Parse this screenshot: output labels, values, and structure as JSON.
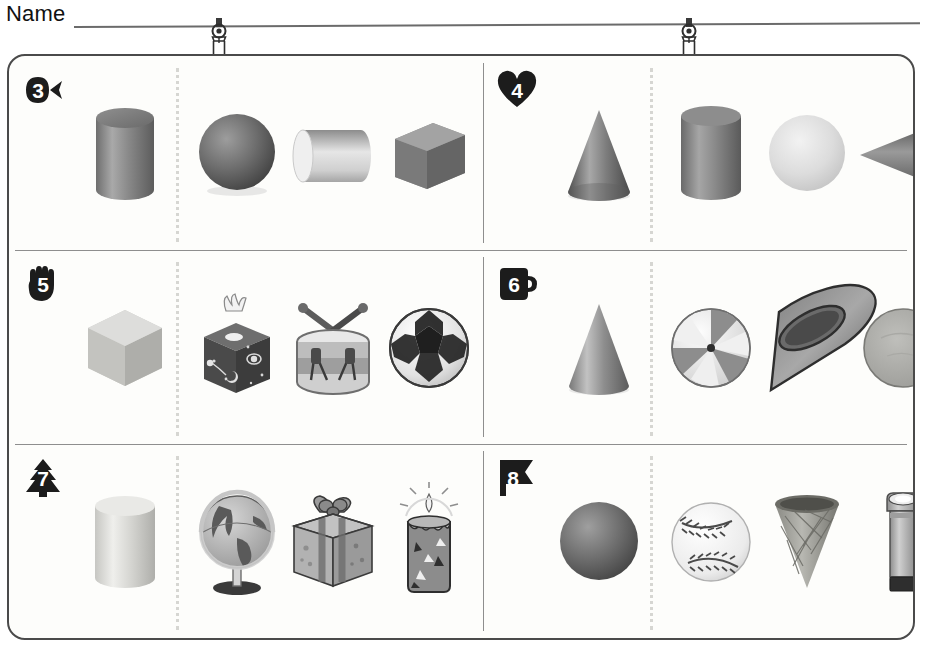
{
  "header": {
    "name_label": "Name",
    "name_value": "",
    "clips": [
      "hanger-clip",
      "hanger-clip"
    ]
  },
  "worksheet": {
    "rows": [
      {
        "panels": [
          {
            "number": "3",
            "badge_shape": "fish",
            "prompt": {
              "name": "cylinder",
              "label": "cylinder"
            },
            "choices": [
              {
                "name": "sphere",
                "label": "sphere"
              },
              {
                "name": "horizontal-cylinder",
                "label": "cylinder"
              },
              {
                "name": "cube",
                "label": "cube"
              }
            ]
          },
          {
            "number": "4",
            "badge_shape": "heart",
            "prompt": {
              "name": "cone",
              "label": "cone"
            },
            "choices": [
              {
                "name": "cylinder",
                "label": "cylinder"
              },
              {
                "name": "sphere",
                "label": "sphere"
              },
              {
                "name": "sideways-cone",
                "label": "cone"
              }
            ]
          }
        ]
      },
      {
        "panels": [
          {
            "number": "5",
            "badge_shape": "hand",
            "prompt": {
              "name": "cube",
              "label": "cube"
            },
            "choices": [
              {
                "name": "tissue-box",
                "label": "tissue box"
              },
              {
                "name": "drum",
                "label": "drum"
              },
              {
                "name": "soccer-ball",
                "label": "soccer ball"
              }
            ]
          },
          {
            "number": "6",
            "badge_shape": "mug",
            "prompt": {
              "name": "cone",
              "label": "cone"
            },
            "choices": [
              {
                "name": "beach-ball",
                "label": "beach ball"
              },
              {
                "name": "funnel-cone",
                "label": "funnel"
              },
              {
                "name": "disc",
                "label": "disc"
              }
            ]
          }
        ]
      },
      {
        "panels": [
          {
            "number": "7",
            "badge_shape": "tree",
            "prompt": {
              "name": "cylinder",
              "label": "cylinder"
            },
            "choices": [
              {
                "name": "globe",
                "label": "globe"
              },
              {
                "name": "gift-box",
                "label": "gift box"
              },
              {
                "name": "candle",
                "label": "candle"
              }
            ]
          },
          {
            "number": "8",
            "badge_shape": "flag",
            "prompt": {
              "name": "sphere",
              "label": "sphere"
            },
            "choices": [
              {
                "name": "baseball",
                "label": "baseball"
              },
              {
                "name": "ice-cream-cone",
                "label": "ice cream cone"
              },
              {
                "name": "flashlight",
                "label": "flashlight"
              }
            ]
          }
        ]
      }
    ]
  },
  "colors": {
    "ink": "#1a1a1a",
    "rule": "#6b6b6b",
    "card_border": "#4a4a4a",
    "divider": "#8e8e8e",
    "dotted": "#d6d6d2",
    "badge_fill": "#1c1c1c",
    "paper": "#fdfdfb"
  }
}
